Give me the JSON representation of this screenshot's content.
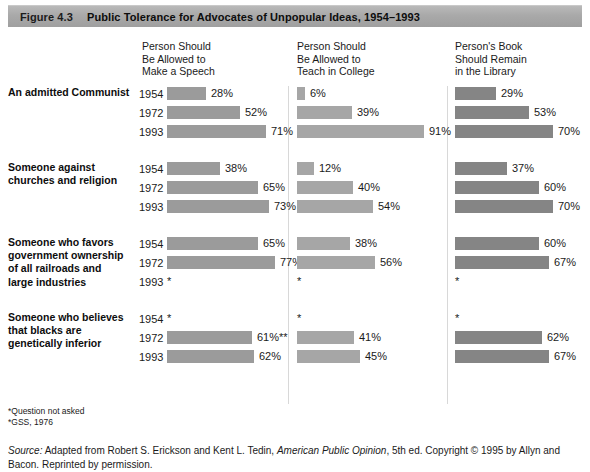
{
  "figure": {
    "number": "Figure 4.3",
    "title": "Public Tolerance for Advocates of Unpopular Ideas, 1954–1993"
  },
  "footnotes": {
    "line1": "*Question not asked",
    "line2": "*GSS, 1976"
  },
  "source": {
    "label": "Source:",
    "text_before": " Adapted from Robert S. Erickson and Kent L. Tedin, ",
    "italic_title": "American Public Opinion",
    "text_after": ", 5th ed. Copyright © 1995 by Allyn and Bacon. Reprinted by permission."
  },
  "chart_data": {
    "type": "bar",
    "title": "Public Tolerance for Advocates of Unpopular Ideas, 1954–1993",
    "xlabel": "",
    "ylabel": "",
    "xlim": [
      0,
      100
    ],
    "grid": false,
    "legend": "none",
    "orientation": "horizontal",
    "value_suffix": "%",
    "not_asked_marker": "*",
    "columns": [
      {
        "key": "speech",
        "label": "Person Should\nBe Allowed to\nMake a Speech",
        "color": "#9b9b9b"
      },
      {
        "key": "teach",
        "label": "Person Should\nBe Allowed to\nTeach in College",
        "color": "#a6a6a6"
      },
      {
        "key": "library",
        "label": "Person's Book\nShould Remain\nin the Library",
        "color": "#858585"
      }
    ],
    "years": [
      "1954",
      "1972",
      "1993"
    ],
    "groups": [
      {
        "label": "An admitted Communist",
        "rows": [
          {
            "year": "1954",
            "speech": 28,
            "speech_label": "28%",
            "teach": 6,
            "teach_label": "6%",
            "library": 29,
            "library_label": "29%"
          },
          {
            "year": "1972",
            "speech": 52,
            "speech_label": "52%",
            "teach": 39,
            "teach_label": "39%",
            "library": 53,
            "library_label": "53%"
          },
          {
            "year": "1993",
            "speech": 71,
            "speech_label": "71%",
            "teach": 91,
            "teach_label": "91%",
            "library": 70,
            "library_label": "70%"
          }
        ]
      },
      {
        "label": "Someone against\nchurches and religion",
        "rows": [
          {
            "year": "1954",
            "speech": 38,
            "speech_label": "38%",
            "teach": 12,
            "teach_label": "12%",
            "library": 37,
            "library_label": "37%"
          },
          {
            "year": "1972",
            "speech": 65,
            "speech_label": "65%",
            "teach": 40,
            "teach_label": "40%",
            "library": 60,
            "library_label": "60%"
          },
          {
            "year": "1993",
            "speech": 73,
            "speech_label": "73%",
            "teach": 54,
            "teach_label": "54%",
            "library": 70,
            "library_label": "70%"
          }
        ]
      },
      {
        "label": "Someone who favors\ngovernment ownership\nof all railroads and\nlarge industries",
        "rows": [
          {
            "year": "1954",
            "speech": 65,
            "speech_label": "65%",
            "teach": 38,
            "teach_label": "38%",
            "library": 60,
            "library_label": "60%"
          },
          {
            "year": "1972",
            "speech": 77,
            "speech_label": "77%",
            "teach": 56,
            "teach_label": "56%",
            "library": 67,
            "library_label": "67%"
          },
          {
            "year": "1993",
            "speech": null,
            "speech_label": "*",
            "teach": null,
            "teach_label": "*",
            "library": null,
            "library_label": "*"
          }
        ]
      },
      {
        "label": "Someone who believes\nthat blacks are\ngenetically inferior",
        "rows": [
          {
            "year": "1954",
            "speech": null,
            "speech_label": "*",
            "teach": null,
            "teach_label": "*",
            "library": null,
            "library_label": "*"
          },
          {
            "year": "1972",
            "speech": 61,
            "speech_label": "61%**",
            "teach": 41,
            "teach_label": "41%",
            "library": 62,
            "library_label": "62%"
          },
          {
            "year": "1993",
            "speech": 62,
            "speech_label": "62%",
            "teach": 45,
            "teach_label": "45%",
            "library": 67,
            "library_label": "67%"
          }
        ]
      }
    ]
  }
}
